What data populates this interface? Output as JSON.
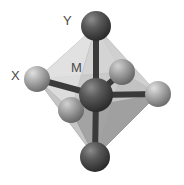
{
  "figure": {
    "type": "molecular-structure-diagram",
    "background_color": "#ffffff",
    "width": 184,
    "height": 185
  },
  "labels": [
    {
      "id": "Y",
      "text": "Y",
      "x": 63,
      "y": 14,
      "color": "#4a4a4a",
      "describes": "axial-top-atom"
    },
    {
      "id": "X",
      "text": "X",
      "x": 11,
      "y": 69,
      "color": "#4a4a4a",
      "describes": "equatorial-left-atom"
    },
    {
      "id": "M",
      "text": "M",
      "x": 71,
      "y": 61,
      "color": "#4a4a4a",
      "describes": "central-metal-atom"
    }
  ],
  "geometry": {
    "shape": "octahedron",
    "face_fill": "#b8b8b8",
    "face_fill_light": "#d6d6d6",
    "face_fill_dark": "#9a9a9a",
    "face_opacity": 0.85,
    "edge_color": "#a0a0a0"
  },
  "atoms": [
    {
      "id": "M",
      "role": "center",
      "cx": 96,
      "cy": 95,
      "r": 17,
      "color_base": "#4f4f4f",
      "color_highlight": "#8c8c8c",
      "color_shadow": "#2e2e2e"
    },
    {
      "id": "Y",
      "role": "axial-top",
      "cx": 96,
      "cy": 26,
      "r": 15,
      "color_base": "#545454",
      "color_highlight": "#909090",
      "color_shadow": "#303030"
    },
    {
      "id": "Z",
      "role": "axial-bottom",
      "cx": 95,
      "cy": 157,
      "r": 15,
      "color_base": "#545454",
      "color_highlight": "#909090",
      "color_shadow": "#303030"
    },
    {
      "id": "X",
      "role": "equatorial-left",
      "cx": 37,
      "cy": 79,
      "r": 13,
      "color_base": "#a8a8a8",
      "color_highlight": "#d8d8d8",
      "color_shadow": "#7a7a7a"
    },
    {
      "id": "X2",
      "role": "equatorial-right",
      "cx": 158,
      "cy": 94,
      "r": 13,
      "color_base": "#a8a8a8",
      "color_highlight": "#d8d8d8",
      "color_shadow": "#7a7a7a"
    },
    {
      "id": "X3",
      "role": "equatorial-back",
      "cx": 122,
      "cy": 72,
      "r": 13,
      "color_base": "#9e9e9e",
      "color_highlight": "#cccccc",
      "color_shadow": "#6e6e6e"
    },
    {
      "id": "X4",
      "role": "equatorial-front",
      "cx": 71,
      "cy": 110,
      "r": 13,
      "color_base": "#9e9e9e",
      "color_highlight": "#cccccc",
      "color_shadow": "#6e6e6e"
    }
  ],
  "bonds": [
    {
      "from": "M",
      "to": "Y",
      "color": "#3a3a3a",
      "width": 5
    },
    {
      "from": "M",
      "to": "Z",
      "color": "#3a3a3a",
      "width": 5
    },
    {
      "from": "M",
      "to": "X",
      "color": "#3a3a3a",
      "width": 5
    },
    {
      "from": "M",
      "to": "X2",
      "color": "#3a3a3a",
      "width": 5
    },
    {
      "from": "M",
      "to": "X3",
      "color": "#3a3a3a",
      "width": 5
    },
    {
      "from": "M",
      "to": "X4",
      "color": "#3a3a3a",
      "width": 5
    }
  ]
}
